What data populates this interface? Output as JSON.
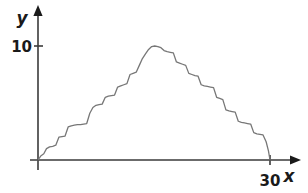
{
  "figure": {
    "background_color": "#ffffff",
    "width": 308,
    "height": 193
  },
  "axes": {
    "x_axis_label": "x",
    "y_axis_label": "y",
    "x_tick_label": "30",
    "y_tick_label": "10",
    "axis_color": "#3a3a3a",
    "label_color": "#1a1a1a"
  },
  "chart_data": {
    "type": "line",
    "title": "",
    "subtitle": "",
    "xlabel": "x",
    "ylabel": "y",
    "xlim": [
      0,
      32.5
    ],
    "ylim": [
      0,
      12.5
    ],
    "grid": false,
    "legend": false,
    "legend_position": "none",
    "line_color": "#777777",
    "line_width": 1.3,
    "xticks": [
      30
    ],
    "xtick_labels": [
      "30"
    ],
    "yticks": [
      10
    ],
    "ytick_labels": [
      "10"
    ],
    "annotations": [],
    "series": [
      {
        "name": "random-walk-path",
        "style": "staircase",
        "x": [
          0,
          0.35,
          0.75,
          1.1,
          1.5,
          1.9,
          2.3,
          2.7,
          3.1,
          3.5,
          3.9,
          4.3,
          4.7,
          5.1,
          5.5,
          5.9,
          6.3,
          6.7,
          7.1,
          7.5,
          7.9,
          8.3,
          8.7,
          9.1,
          9.5,
          9.9,
          10.3,
          10.7,
          11.1,
          11.5,
          11.9,
          12.3,
          12.7,
          13.1,
          13.5,
          13.9,
          14.3,
          14.7,
          15.1,
          15.5,
          15.9,
          16.3,
          16.7,
          17.1,
          17.5,
          17.9,
          18.3,
          18.7,
          19.1,
          19.5,
          19.9,
          20.3,
          20.7,
          21.1,
          21.5,
          21.9,
          22.3,
          22.7,
          23.1,
          23.5,
          23.9,
          24.3,
          24.7,
          25.1,
          25.5,
          25.9,
          26.3,
          26.7,
          27.1,
          27.5,
          27.9,
          28.3,
          28.7,
          29.1,
          29.5,
          29.8,
          30
        ],
        "y": [
          0,
          0.35,
          0.55,
          1.0,
          1.15,
          1.2,
          1.3,
          2.0,
          2.05,
          2.1,
          2.9,
          3.0,
          3.05,
          3.1,
          3.1,
          3.15,
          3.2,
          4.1,
          4.6,
          4.8,
          4.85,
          4.9,
          5.5,
          5.6,
          5.65,
          5.7,
          6.4,
          6.5,
          6.6,
          6.7,
          7.5,
          7.6,
          7.7,
          8.3,
          8.9,
          9.3,
          9.7,
          9.95,
          10.0,
          9.95,
          9.85,
          9.6,
          9.5,
          9.45,
          9.4,
          8.6,
          8.5,
          8.4,
          8.3,
          7.6,
          7.5,
          7.4,
          7.35,
          6.6,
          6.5,
          6.45,
          6.4,
          6.35,
          5.5,
          5.4,
          5.3,
          4.4,
          4.3,
          4.25,
          4.2,
          3.4,
          3.3,
          3.25,
          3.2,
          3.15,
          2.4,
          2.3,
          2.25,
          2.2,
          1.6,
          0.8,
          0
        ]
      }
    ]
  }
}
